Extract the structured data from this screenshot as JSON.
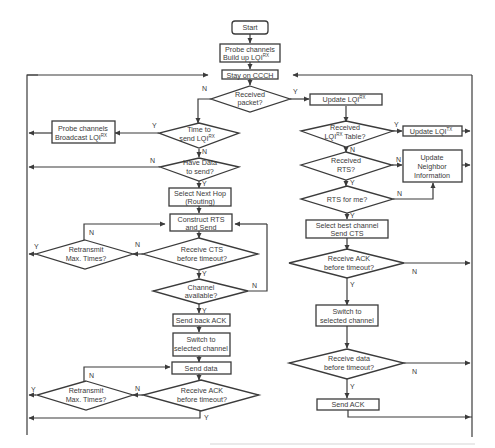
{
  "diagram": {
    "nodes": {
      "start": "Start",
      "probe_build_1": "Probe channels",
      "probe_build_2": "Build up LQI",
      "stay_ccch": "Stay on CCCH",
      "received_packet_1": "Received",
      "received_packet_2": "packet?",
      "time_to_send_1": "Time to",
      "time_to_send_2": "send LQI",
      "probe_broadcast_1": "Probe channels",
      "probe_broadcast_2": "Broadcast LQI",
      "have_data_1": "Have Data",
      "have_data_2": "to send?",
      "select_next_hop_1": "Select Next Hop",
      "select_next_hop_2": "(Routing)",
      "construct_rts_1": "Construct RTS",
      "construct_rts_2": "and Send",
      "retransmit_1a": "Retransmit",
      "retransmit_1b": "Max. Times?",
      "receive_cts_1": "Receive CTS",
      "receive_cts_2": "before timeout?",
      "channel_avail_1": "Channel",
      "channel_avail_2": "available?",
      "send_back_ack": "Send back ACK",
      "switch_left_1": "Switch to",
      "switch_left_2": "selected channel",
      "send_data": "Send data",
      "retransmit_2a": "Retransmit",
      "retransmit_2b": "Max. Times?",
      "receive_ack_left_1": "Receive ACK",
      "receive_ack_left_2": "before timeout?",
      "update_lqi_rx": "Update LQI",
      "received_table_1": "Received",
      "received_table_2": "LQI",
      "received_table_2b": " Table?",
      "update_lqi_tx": "Update LQI",
      "received_rts_1": "Received",
      "received_rts_2": "RTS?",
      "update_neighbor_1": "Update",
      "update_neighbor_2": "Neighbor",
      "update_neighbor_3": "Information",
      "rts_for_me": "RTS for me?",
      "select_best_1": "Select best channel",
      "select_best_2": "Send CTS",
      "receive_ack_right_1": "Receive ACK",
      "receive_ack_right_2": "before timeout?",
      "switch_right_1": "Switch to",
      "switch_right_2": "selected channel",
      "receive_data_1": "Receive data",
      "receive_data_2": "before timeout?",
      "send_ack": "Send ACK"
    },
    "superscripts": {
      "rx": "RX",
      "tx": "TX"
    },
    "edge_labels": {
      "yes": "Y",
      "no": "N"
    },
    "colors": {
      "stroke": "#3b3b3b",
      "text": "#3a3a3a",
      "background": "#ffffff"
    }
  }
}
